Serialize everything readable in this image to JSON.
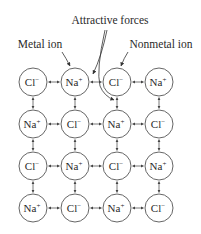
{
  "diagram": {
    "labels": {
      "attractive_forces": "Attractive forces",
      "metal_ion": "Metal ion",
      "nonmetal_ion": "Nonmetal ion"
    },
    "grid": {
      "rows": 4,
      "cols": 4,
      "cells": [
        [
          {
            "symbol": "Cl",
            "charge": "-"
          },
          {
            "symbol": "Na",
            "charge": "+"
          },
          {
            "symbol": "Cl",
            "charge": "-"
          },
          {
            "symbol": "Na",
            "charge": "+"
          }
        ],
        [
          {
            "symbol": "Na",
            "charge": "+"
          },
          {
            "symbol": "Cl",
            "charge": "-"
          },
          {
            "symbol": "Na",
            "charge": "+"
          },
          {
            "symbol": "Cl",
            "charge": "-"
          }
        ],
        [
          {
            "symbol": "Cl",
            "charge": "-"
          },
          {
            "symbol": "Na",
            "charge": "+"
          },
          {
            "symbol": "Cl",
            "charge": "-"
          },
          {
            "symbol": "Na",
            "charge": "+"
          }
        ],
        [
          {
            "symbol": "Na",
            "charge": "+"
          },
          {
            "symbol": "Cl",
            "charge": "-"
          },
          {
            "symbol": "Na",
            "charge": "+"
          },
          {
            "symbol": "Cl",
            "charge": "-"
          }
        ]
      ]
    },
    "connections": "double-headed arrows between horizontally and vertically adjacent ions",
    "colors": {
      "line": "#555555",
      "text": "#2a2a2a",
      "background": "#ffffff"
    }
  }
}
